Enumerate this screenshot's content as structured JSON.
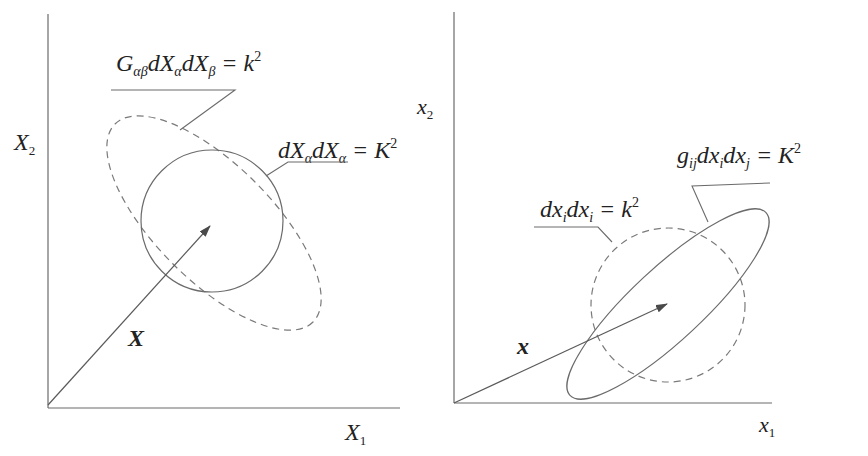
{
  "left_panel": {
    "y_axis_label": "X",
    "y_axis_subscript": "2",
    "x_axis_label": "X",
    "x_axis_subscript": "1",
    "vector_label": "X",
    "ellipse_equation": {
      "parts": [
        "G",
        "αβ",
        "dX",
        "α",
        "dX",
        "β",
        " = k",
        "2"
      ],
      "text": "GαβdXαdXβ = k²"
    },
    "circle_equation": {
      "parts": [
        "dX",
        "α",
        "dX",
        "α",
        " = K",
        "2"
      ],
      "text": "dXαdXα = K²"
    }
  },
  "right_panel": {
    "y_axis_label": "x",
    "y_axis_subscript": "2",
    "x_axis_label": "x",
    "x_axis_subscript": "1",
    "vector_label": "x",
    "ellipse_equation": {
      "parts": [
        "g",
        "ij",
        "dx",
        "i",
        "dx",
        "j",
        " = K",
        "2"
      ],
      "text": "gijdxidxj = K²"
    },
    "circle_equation": {
      "parts": [
        "dx",
        "i",
        "dx",
        "i",
        " = k",
        "2"
      ],
      "text": "dxidxi = k²"
    }
  },
  "colors": {
    "line": "#6b6b6b",
    "text": "#222222"
  }
}
